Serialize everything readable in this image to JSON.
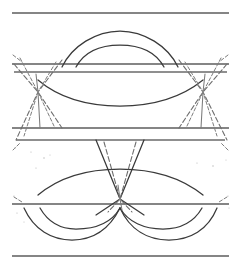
{
  "figure": {
    "kind": "eye-diagram",
    "title": "",
    "caption": "",
    "background_color": "#ffffff",
    "ink_color": "#3a3a3a",
    "rail_color": "#5d5d5d",
    "width_px": 241,
    "height_px": 271
  },
  "chart_data": {
    "type": "line",
    "title": "",
    "subtitle": "",
    "xlabel": "",
    "ylabel": "",
    "xlim": [
      0,
      241
    ],
    "ylim": [
      0,
      271
    ],
    "grid": false,
    "legend": "none",
    "annotations": [],
    "crossing_points": [
      {
        "name": "left-crossing",
        "x": 38,
        "y": 92
      },
      {
        "name": "center-crossing",
        "x": 120,
        "y": 199
      },
      {
        "name": "right-crossing",
        "x": 203,
        "y": 92
      }
    ],
    "rails": [
      {
        "name": "top-frame-rail",
        "y": 13,
        "x0": 12,
        "x1": 229
      },
      {
        "name": "upper-rail-a",
        "y": 64,
        "x0": 12,
        "x1": 229
      },
      {
        "name": "upper-rail-b",
        "y": 72,
        "x0": 14,
        "x1": 227
      },
      {
        "name": "mid-rail-a",
        "y": 128,
        "x0": 12,
        "x1": 229
      },
      {
        "name": "mid-rail-b",
        "y": 140,
        "x0": 16,
        "x1": 225
      },
      {
        "name": "lower-rail",
        "y": 204,
        "x0": 12,
        "x1": 229
      },
      {
        "name": "bottom-frame-rail",
        "y": 256,
        "x0": 12,
        "x1": 229
      }
    ],
    "series": [
      {
        "name": "upper-eye-outer-arc",
        "shape": "arch-up",
        "points": [
          [
            62,
            67
          ],
          [
            90,
            36
          ],
          [
            120,
            31
          ],
          [
            150,
            36
          ],
          [
            178,
            67
          ]
        ]
      },
      {
        "name": "upper-eye-inner-arc",
        "shape": "arch-up",
        "points": [
          [
            76,
            67
          ],
          [
            98,
            48
          ],
          [
            120,
            45
          ],
          [
            142,
            48
          ],
          [
            164,
            67
          ]
        ]
      },
      {
        "name": "upper-eye-lower-envelope",
        "shape": "valley",
        "points": [
          [
            38,
            80
          ],
          [
            70,
            99
          ],
          [
            120,
            106
          ],
          [
            170,
            99
          ],
          [
            203,
            80
          ]
        ]
      },
      {
        "name": "lower-eye-upper-envelope",
        "shape": "arch-up",
        "points": [
          [
            38,
            195
          ],
          [
            70,
            176
          ],
          [
            120,
            169
          ],
          [
            170,
            176
          ],
          [
            203,
            195
          ]
        ]
      },
      {
        "name": "lower-eye-outer-arc-left",
        "shape": "valley",
        "points": [
          [
            24,
            208
          ],
          [
            48,
            230
          ],
          [
            72,
            238
          ],
          [
            96,
            230
          ],
          [
            120,
            208
          ]
        ]
      },
      {
        "name": "lower-eye-inner-arc-left",
        "shape": "valley",
        "points": [
          [
            38,
            208
          ],
          [
            58,
            222
          ],
          [
            74,
            227
          ],
          [
            92,
            222
          ],
          [
            120,
            208
          ]
        ]
      },
      {
        "name": "lower-eye-outer-arc-right",
        "shape": "valley",
        "points": [
          [
            120,
            208
          ],
          [
            145,
            230
          ],
          [
            169,
            238
          ],
          [
            193,
            230
          ],
          [
            217,
            208
          ]
        ]
      },
      {
        "name": "lower-eye-inner-arc-right",
        "shape": "valley",
        "points": [
          [
            120,
            208
          ],
          [
            149,
            222
          ],
          [
            167,
            227
          ],
          [
            183,
            222
          ],
          [
            203,
            208
          ]
        ]
      },
      {
        "name": "left-crossing-edge-rising",
        "shape": "line",
        "points": [
          [
            14,
            64
          ],
          [
            38,
            92
          ],
          [
            62,
            128
          ]
        ]
      },
      {
        "name": "left-crossing-edge-falling",
        "shape": "line",
        "points": [
          [
            62,
            60
          ],
          [
            38,
            92
          ],
          [
            16,
            140
          ]
        ]
      },
      {
        "name": "right-crossing-edge-rising",
        "shape": "line",
        "points": [
          [
            179,
            60
          ],
          [
            203,
            92
          ],
          [
            227,
            140
          ]
        ]
      },
      {
        "name": "right-crossing-edge-falling",
        "shape": "line",
        "points": [
          [
            227,
            64
          ],
          [
            203,
            92
          ],
          [
            179,
            128
          ]
        ]
      },
      {
        "name": "center-crossing-edge-rising",
        "shape": "line",
        "points": [
          [
            96,
            140
          ],
          [
            120,
            199
          ],
          [
            144,
            215
          ]
        ]
      },
      {
        "name": "center-crossing-edge-falling",
        "shape": "line",
        "points": [
          [
            144,
            140
          ],
          [
            120,
            199
          ],
          [
            96,
            215
          ]
        ]
      }
    ]
  }
}
